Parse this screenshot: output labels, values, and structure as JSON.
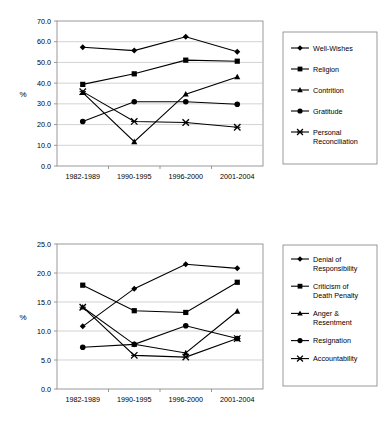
{
  "charts": [
    {
      "id": "chart-top",
      "chart_data": {
        "type": "line",
        "title": "",
        "xlabel": "",
        "ylabel": "%",
        "categories": [
          "1982-1989",
          "1990-1995",
          "1996-2000",
          "2001-2004"
        ],
        "ylim": [
          0.0,
          70.0
        ],
        "ytick_step": 10.0,
        "yticks": [
          "0.0",
          "10.0",
          "20.0",
          "30.0",
          "40.0",
          "50.0",
          "60.0",
          "70.0"
        ],
        "grid": true,
        "legend_position": "right",
        "series": [
          {
            "name": "Well-Wishes",
            "marker": "diamond",
            "values": [
              57.3,
              55.7,
              62.4,
              55.2
            ]
          },
          {
            "name": "Religion",
            "marker": "square",
            "values": [
              39.4,
              44.5,
              51.1,
              50.6
            ]
          },
          {
            "name": "Contrition",
            "marker": "triangle",
            "values": [
              35.4,
              11.7,
              34.7,
              43.0
            ]
          },
          {
            "name": "Gratitude",
            "marker": "circle",
            "values": [
              21.5,
              31.0,
              31.0,
              29.8
            ]
          },
          {
            "name": "Personal Reconciliation",
            "marker": "x",
            "values": [
              35.9,
              21.5,
              21.0,
              18.7
            ]
          }
        ]
      }
    },
    {
      "id": "chart-bottom",
      "chart_data": {
        "type": "line",
        "title": "",
        "xlabel": "",
        "ylabel": "%",
        "categories": [
          "1982-1989",
          "1990-1995",
          "1996-2000",
          "2001-2004"
        ],
        "ylim": [
          0.0,
          25.0
        ],
        "ytick_step": 5.0,
        "yticks": [
          "0.0",
          "5.0",
          "10.0",
          "15.0",
          "20.0",
          "25.0"
        ],
        "grid": true,
        "legend_position": "right",
        "series": [
          {
            "name": "Denial of Responsibility",
            "marker": "diamond",
            "values": [
              10.8,
              17.3,
              21.5,
              20.8
            ]
          },
          {
            "name": "Criticism of Death Penalty",
            "marker": "square",
            "values": [
              17.9,
              13.5,
              13.2,
              18.4
            ]
          },
          {
            "name": "Anger & Resentment",
            "marker": "triangle",
            "values": [
              14.1,
              7.7,
              6.2,
              13.4
            ]
          },
          {
            "name": "Resignation",
            "marker": "circle",
            "values": [
              7.2,
              7.7,
              10.9,
              8.7
            ]
          },
          {
            "name": "Accountability",
            "marker": "x",
            "values": [
              14.1,
              5.8,
              5.5,
              8.7
            ]
          }
        ]
      }
    }
  ]
}
